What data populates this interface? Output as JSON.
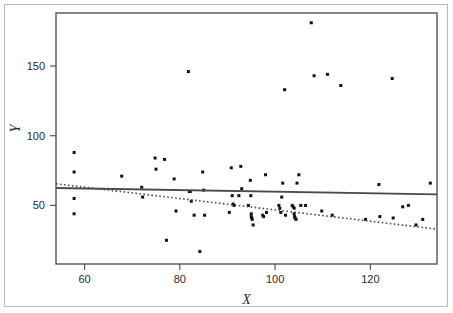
{
  "figure": {
    "background_color": "#ffffff",
    "frame_color": "#555555",
    "outer_border_color": "#b9b9b9"
  },
  "chart_data": {
    "type": "scatter",
    "title": "",
    "xlabel": "X",
    "ylabel": "Y",
    "xlim": [
      54,
      134
    ],
    "ylim": [
      8,
      188
    ],
    "xticks": [
      60,
      80,
      100,
      120
    ],
    "yticks": [
      50,
      100,
      150
    ],
    "xtick_labels": [
      "60",
      "80",
      "100",
      "120"
    ],
    "ytick_labels": [
      "50",
      "100",
      "150"
    ],
    "grid": false,
    "legend": "none",
    "point_color": "#111111",
    "point_size": 3,
    "points": [
      [
        57.8,
        88
      ],
      [
        57.8,
        74
      ],
      [
        57.8,
        55
      ],
      [
        57.8,
        44
      ],
      [
        67.8,
        71
      ],
      [
        72.0,
        63
      ],
      [
        72.2,
        56
      ],
      [
        74.8,
        84
      ],
      [
        75.0,
        76
      ],
      [
        76.8,
        83
      ],
      [
        77.2,
        25
      ],
      [
        78.8,
        69
      ],
      [
        79.2,
        46
      ],
      [
        81.8,
        146
      ],
      [
        82.0,
        60
      ],
      [
        82.2,
        60
      ],
      [
        82.4,
        53
      ],
      [
        83.0,
        43
      ],
      [
        84.2,
        17
      ],
      [
        84.8,
        74
      ],
      [
        85.0,
        61
      ],
      [
        85.2,
        43
      ],
      [
        90.4,
        45
      ],
      [
        90.8,
        77
      ],
      [
        91.0,
        57
      ],
      [
        91.2,
        51
      ],
      [
        91.4,
        50
      ],
      [
        92.4,
        57
      ],
      [
        92.8,
        78
      ],
      [
        93.0,
        62
      ],
      [
        94.4,
        50
      ],
      [
        94.8,
        68
      ],
      [
        94.9,
        57
      ],
      [
        95.0,
        44
      ],
      [
        95.0,
        42
      ],
      [
        95.1,
        41
      ],
      [
        95.2,
        40
      ],
      [
        95.4,
        36
      ],
      [
        97.4,
        43
      ],
      [
        97.6,
        42
      ],
      [
        98.0,
        72
      ],
      [
        98.2,
        45
      ],
      [
        100.8,
        50
      ],
      [
        101.0,
        48
      ],
      [
        101.2,
        45
      ],
      [
        101.4,
        56
      ],
      [
        101.6,
        66
      ],
      [
        102.0,
        133
      ],
      [
        102.2,
        43
      ],
      [
        103.6,
        50
      ],
      [
        103.8,
        49
      ],
      [
        104.0,
        48
      ],
      [
        104.0,
        44
      ],
      [
        104.1,
        42
      ],
      [
        104.2,
        41
      ],
      [
        104.4,
        40
      ],
      [
        104.6,
        66
      ],
      [
        105.0,
        72
      ],
      [
        105.4,
        50
      ],
      [
        106.4,
        50
      ],
      [
        107.6,
        181
      ],
      [
        108.2,
        143
      ],
      [
        109.8,
        46
      ],
      [
        111.0,
        144
      ],
      [
        112.0,
        43
      ],
      [
        113.8,
        136
      ],
      [
        119.0,
        40
      ],
      [
        121.8,
        65
      ],
      [
        122.0,
        42
      ],
      [
        124.6,
        141
      ],
      [
        124.8,
        41
      ],
      [
        126.8,
        49
      ],
      [
        128.0,
        50
      ],
      [
        129.6,
        36
      ],
      [
        131.0,
        40
      ],
      [
        132.6,
        66
      ]
    ],
    "lines": [
      {
        "name": "ols-fit-line",
        "style": "solid",
        "color": "#4a4a4a",
        "width": 1.8,
        "x": [
          54,
          134
        ],
        "y": [
          62.5,
          58.0
        ]
      },
      {
        "name": "robust-fit-line",
        "style": "dotted",
        "color": "#4a4a4a",
        "width": 1.6,
        "x": [
          54,
          134
        ],
        "y": [
          65.5,
          33.0
        ]
      }
    ]
  }
}
